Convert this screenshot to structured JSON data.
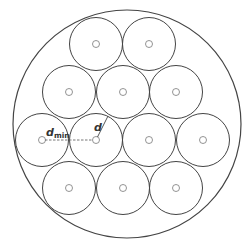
{
  "diagram": {
    "outer_circle": {
      "cx": 127,
      "cy": 124,
      "r": 114
    },
    "small_radius": 26.5,
    "dot_radius": 3.5,
    "stroke_color": "#444444",
    "centers": [
      {
        "cx": 96,
        "cy": 44
      },
      {
        "cx": 149,
        "cy": 44
      },
      {
        "cx": 69,
        "cy": 92
      },
      {
        "cx": 123,
        "cy": 92
      },
      {
        "cx": 176,
        "cy": 92
      },
      {
        "cx": 42,
        "cy": 140
      },
      {
        "cx": 96,
        "cy": 140
      },
      {
        "cx": 149,
        "cy": 140
      },
      {
        "cx": 203,
        "cy": 140
      },
      {
        "cx": 69,
        "cy": 188
      },
      {
        "cx": 123,
        "cy": 188
      },
      {
        "cx": 176,
        "cy": 188
      }
    ],
    "labels": {
      "dmin_main": "d",
      "dmin_sub": "min",
      "d": "d"
    }
  }
}
